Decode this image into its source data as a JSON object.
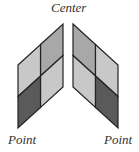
{
  "labels": {
    "top": "Center",
    "bottom_left": "Point",
    "bottom_right": "Point"
  },
  "colors": {
    "light": "#c8c8c8",
    "mid": "#a8a8a8",
    "dark": "#5a5a5a",
    "stroke": "#222222"
  }
}
